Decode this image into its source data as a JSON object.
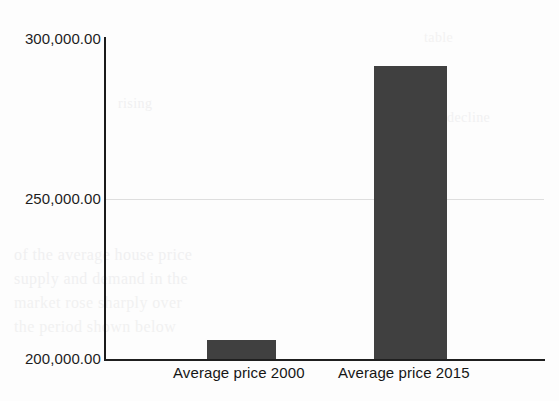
{
  "chart_data": {
    "type": "bar",
    "title": "",
    "subtitle": "",
    "xlabel": "",
    "ylabel": "",
    "categories": [
      "Average price 2000",
      "Average price 2015"
    ],
    "values": [
      206000,
      291000
    ],
    "series": [
      {
        "name": "Average price",
        "values": [
          206000,
          291000
        ]
      }
    ],
    "ylim": [
      200000,
      300000
    ],
    "yticks": [
      200000,
      250000,
      300000
    ],
    "ytick_labels": [
      "200,000.00",
      "250,000.00",
      "300,000.00"
    ],
    "grid": "horizontal-at-250000-only",
    "legend": "none",
    "bar_color": "#404040",
    "axis_color": "#1b1b1b",
    "gridline_color": "#dedede",
    "background_color": "#fdfdfd"
  },
  "axis": {
    "y_tick_300k": "300,000.00",
    "y_tick_250k": "250,000.00",
    "y_tick_200k": "200,000.00"
  },
  "categories": {
    "first": "Average price 2000",
    "second": "Average price 2015"
  },
  "ghosts": {
    "g1": "rising",
    "g2": "decline",
    "g3": "of the average house price",
    "g4": "supply and demand in the",
    "g5": "market rose sharply over",
    "g6": "the period shown below",
    "g7": "table"
  }
}
